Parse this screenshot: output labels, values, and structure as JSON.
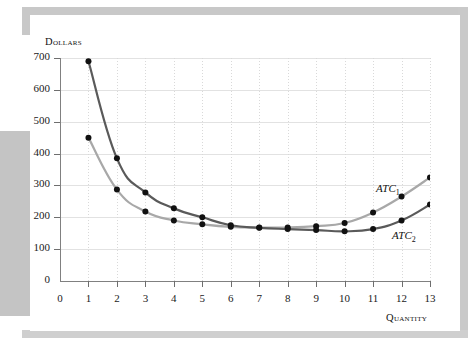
{
  "chart_data": {
    "type": "line",
    "title": "",
    "xlabel": "Quantity",
    "ylabel": "Dollars",
    "xlim": [
      0,
      13
    ],
    "ylim": [
      0,
      700
    ],
    "grid": true,
    "legend_position": "inline-annotation",
    "x_ticks": [
      "0",
      "1",
      "2",
      "3",
      "4",
      "5",
      "6",
      "7",
      "8",
      "9",
      "10",
      "11",
      "12",
      "13"
    ],
    "y_ticks": [
      "0",
      "100",
      "200",
      "300",
      "400",
      "500",
      "600",
      "700"
    ],
    "x": [
      1,
      2,
      3,
      4,
      5,
      6,
      7,
      8,
      9,
      10,
      11,
      12,
      13
    ],
    "series": [
      {
        "name": "ATC1",
        "label": "ATC",
        "label_sub": "1",
        "color": "#a8a8a8",
        "values": [
          450,
          287,
          218,
          190,
          178,
          170,
          168,
          168,
          172,
          182,
          215,
          265,
          325
        ]
      },
      {
        "name": "ATC2",
        "label": "ATC",
        "label_sub": "2",
        "color": "#5a5a5a",
        "values": [
          690,
          385,
          278,
          228,
          200,
          175,
          167,
          163,
          160,
          156,
          163,
          190,
          240
        ]
      }
    ],
    "marker_color": "#111111"
  }
}
